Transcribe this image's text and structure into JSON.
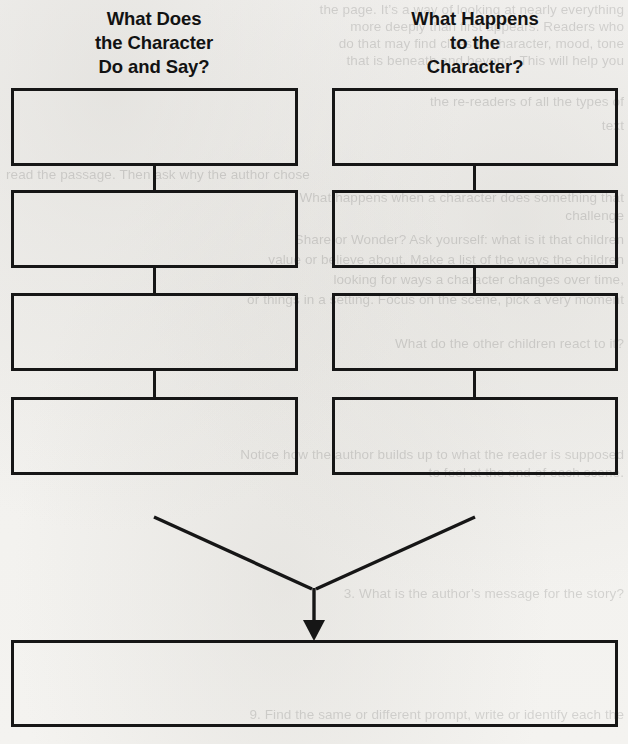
{
  "page": {
    "width": 628,
    "height": 744,
    "background_color": "#f4f3f1",
    "ink_color": "#161616"
  },
  "headings": [
    {
      "id": "left",
      "name": "what-does-the-character-do-and-say",
      "lines": [
        "What Does",
        "the Character",
        "Do and Say?"
      ],
      "line1": "What Does",
      "line2": "the Character",
      "line3": "Do and Say?"
    },
    {
      "id": "right",
      "name": "what-happens-to-the-character",
      "lines": [
        "What Happens",
        "to the",
        "Character?"
      ],
      "line1": "What Happens",
      "line2": "to the",
      "line3": "Character?"
    }
  ],
  "columns": {
    "left": {
      "heading_ref": "What Does the Character Do and Say?",
      "box_count": 4,
      "boxes": [
        {
          "index": 1,
          "value": ""
        },
        {
          "index": 2,
          "value": ""
        },
        {
          "index": 3,
          "value": ""
        },
        {
          "index": 4,
          "value": ""
        }
      ]
    },
    "right": {
      "heading_ref": "What Happens to the Character?",
      "box_count": 4,
      "boxes": [
        {
          "index": 1,
          "value": ""
        },
        {
          "index": 2,
          "value": ""
        },
        {
          "index": 3,
          "value": ""
        },
        {
          "index": 4,
          "value": ""
        }
      ]
    }
  },
  "conclusion_box": {
    "name": "conclusion-box",
    "value": ""
  },
  "arrow": {
    "direction": "down",
    "style": "filled-triangle"
  },
  "ghost_text": {
    "note": "faint show-through text from the reverse side of the page",
    "lines": [
      "the page. It’s a way of looking at nearly everything",
      "more deeply than first appears. Readers who",
      "do that may find clues to character, mood, tone",
      "that is beneath and beyond. This will help you",
      "",
      "the re-readers of all the types of",
      "text",
      "read the passage. Then ask why the author chose",
      "What happens when a character does something that",
      "challenge",
      "Share or Wonder? Ask yourself: what is it that children",
      "value or believe about. Make a list of the ways the children",
      "looking for ways a character changes over time,",
      "or things in a setting. Focus on the scene, pick a very moment",
      "",
      "What do the other children react to it?",
      "",
      "",
      "",
      "Notice how the author builds up to what the reader is supposed",
      "to feel at the end of each scene.",
      "",
      "",
      "3. What is the author’s message for the story?",
      "",
      "",
      "9. Find the same or different prompt, write or identify each the",
      "Compare."
    ]
  },
  "layout": {
    "left_column": {
      "x": 11,
      "width": 287
    },
    "right_column": {
      "x": 332,
      "width": 286
    },
    "box_tops": [
      88,
      190,
      293,
      397
    ],
    "box_height": 78,
    "bottom_box": {
      "x": 11,
      "y": 640,
      "width": 607,
      "height": 87
    }
  }
}
